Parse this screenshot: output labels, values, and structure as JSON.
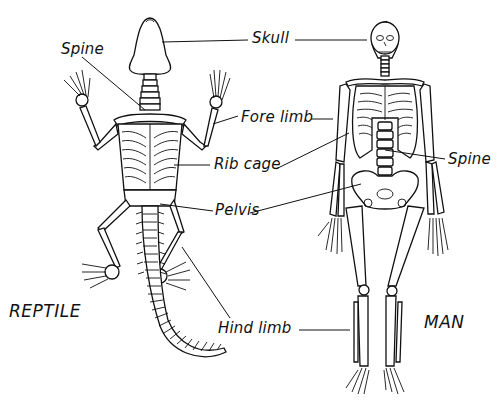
{
  "diagram": {
    "subjects": [
      {
        "id": "reptile",
        "label": "REPTILE"
      },
      {
        "id": "man",
        "label": "MAN"
      }
    ],
    "labels": {
      "skull": "Skull",
      "spine_reptile": "Spine",
      "fore_limb": "Fore limb",
      "rib_cage": "Rib cage",
      "spine_man": "Spine",
      "pelvis": "Pelvis",
      "hind_limb": "Hind limb"
    },
    "colors": {
      "ink": "#111111",
      "background": "#ffffff"
    }
  }
}
